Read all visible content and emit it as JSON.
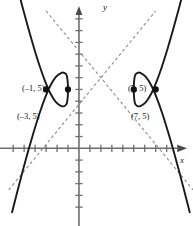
{
  "figure": {
    "title": "",
    "axis_labels": {
      "x": "x",
      "y": "y"
    },
    "point_labels": {
      "vertex_left": "(–1, 5)",
      "focus_left": "(–3, 5)",
      "vertex_right": "(5, 5)",
      "focus_right": "(7, 5)"
    },
    "colors": {
      "curve": "#1a1a1a",
      "asymptote": "#8c8c8c",
      "axis": "#6e6e6e",
      "point": "#111111",
      "text": "#1a1a1a",
      "background": "#ffffff"
    }
  },
  "chart_data": {
    "type": "line",
    "xlabel": "x",
    "ylabel": "y",
    "grid": false,
    "legend": null,
    "xlim": [
      -7.2,
      10.4
    ],
    "ylim": [
      -6.6,
      12.6
    ],
    "x_ticks": [
      -6,
      -5,
      -4,
      -3,
      -2,
      -1,
      1,
      2,
      3,
      4,
      5,
      6,
      7,
      8,
      9
    ],
    "y_ticks": [
      -5,
      -4,
      -3,
      -2,
      -1,
      1,
      2,
      3,
      4,
      5,
      6,
      7,
      8,
      9,
      10,
      11
    ],
    "tick_labels_shown": false,
    "axes_arrows": [
      "x-positive",
      "y-positive"
    ],
    "conic": {
      "kind": "hyperbola",
      "orientation": "horizontal",
      "center": [
        2,
        5
      ],
      "a": 3,
      "b": 4,
      "c": 5,
      "equation": "(x - 2)^2 / 9 - (y - 5)^2 / 16 = 1"
    },
    "series": [
      {
        "name": "left branch",
        "style": "solid",
        "color": "#1a1a1a",
        "points": [
          [
            -6.1,
            15.44
          ],
          [
            -5.6,
            13.6
          ],
          [
            -5.1,
            11.83
          ],
          [
            -4.6,
            10.13
          ],
          [
            -4.1,
            8.53
          ],
          [
            -3.6,
            7.04
          ],
          [
            -3.1,
            5.73
          ],
          [
            -2.6,
            4.66
          ],
          [
            -2.1,
            3.93
          ],
          [
            -1.6,
            3.59
          ],
          [
            -1.35,
            3.59
          ],
          [
            -1.1,
            3.85
          ],
          [
            -1.0,
            5.0
          ],
          [
            -1.1,
            6.15
          ],
          [
            -1.35,
            6.41
          ],
          [
            -1.6,
            6.41
          ],
          [
            -2.1,
            6.07
          ],
          [
            -2.6,
            5.34
          ],
          [
            -3.1,
            4.27
          ],
          [
            -3.6,
            2.96
          ],
          [
            -4.1,
            1.47
          ],
          [
            -4.6,
            -0.13
          ],
          [
            -5.1,
            -1.83
          ],
          [
            -5.6,
            -3.6
          ],
          [
            -6.1,
            -5.44
          ]
        ]
      },
      {
        "name": "right branch",
        "style": "solid",
        "color": "#1a1a1a",
        "points": [
          [
            10.1,
            15.44
          ],
          [
            9.6,
            13.6
          ],
          [
            9.1,
            11.83
          ],
          [
            8.6,
            10.13
          ],
          [
            8.1,
            8.53
          ],
          [
            7.6,
            7.04
          ],
          [
            7.1,
            5.73
          ],
          [
            6.6,
            4.66
          ],
          [
            6.1,
            3.93
          ],
          [
            5.6,
            3.59
          ],
          [
            5.35,
            3.59
          ],
          [
            5.1,
            3.85
          ],
          [
            5.0,
            5.0
          ],
          [
            5.1,
            6.15
          ],
          [
            5.35,
            6.41
          ],
          [
            5.6,
            6.41
          ],
          [
            6.1,
            6.07
          ],
          [
            6.6,
            5.34
          ],
          [
            7.1,
            4.27
          ],
          [
            7.6,
            2.96
          ],
          [
            8.1,
            1.47
          ],
          [
            8.6,
            -0.13
          ],
          [
            9.1,
            -1.83
          ],
          [
            9.6,
            -3.6
          ],
          [
            10.1,
            -5.44
          ]
        ]
      },
      {
        "name": "asymptote positive slope",
        "style": "dashed",
        "color": "#8c8c8c",
        "slope": 1.3333,
        "intercept": 2.3333,
        "endpoints": [
          [
            -6.4,
            -3.53
          ],
          [
            7.0,
            11.67
          ]
        ]
      },
      {
        "name": "asymptote negative slope",
        "style": "dashed",
        "color": "#8c8c8c",
        "slope": -1.3333,
        "intercept": 7.6667,
        "endpoints": [
          [
            -3.0,
            11.67
          ],
          [
            10.4,
            -3.53
          ]
        ]
      }
    ],
    "annotated_points": [
      {
        "label": "(–3, 5)",
        "x": -3,
        "y": 5,
        "role": "focus",
        "marker": "filled-circle",
        "label_position": "below-left"
      },
      {
        "label": "(–1, 5)",
        "x": -1,
        "y": 5,
        "role": "vertex",
        "marker": "filled-circle",
        "label_position": "above-left"
      },
      {
        "label": "(5, 5)",
        "x": 5,
        "y": 5,
        "role": "vertex",
        "marker": "filled-circle",
        "label_position": "above-right"
      },
      {
        "label": "(7, 5)",
        "x": 7,
        "y": 5,
        "role": "focus",
        "marker": "filled-circle",
        "label_position": "below-right"
      }
    ]
  }
}
